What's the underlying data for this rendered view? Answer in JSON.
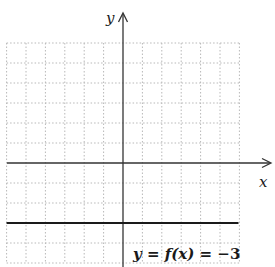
{
  "chart_data": {
    "type": "line",
    "title": "",
    "xlabel": "x",
    "ylabel": "y",
    "xlim": [
      -6,
      6
    ],
    "ylim": [
      -5,
      6
    ],
    "grid": true,
    "grid_style": "dotted",
    "tick_labels": false,
    "series": [
      {
        "name": "y = f(x) = -3",
        "equation": "y = f(x) = −3",
        "x": [
          -6,
          6
        ],
        "y": [
          -3,
          -3
        ]
      }
    ],
    "annotations": [
      {
        "text": "y = f(x) = −3",
        "position": "below line, right of y-axis"
      }
    ]
  },
  "labels": {
    "x_axis": "x",
    "y_axis": "y",
    "equation_y": "y",
    "equation_eq1": " = ",
    "equation_f": "f",
    "equation_x": "(x)",
    "equation_rest": " = −3"
  },
  "colors": {
    "axis": "#333333",
    "grid": "#b8b8b8",
    "line": "#1a1a1a",
    "background": "#ffffff"
  }
}
